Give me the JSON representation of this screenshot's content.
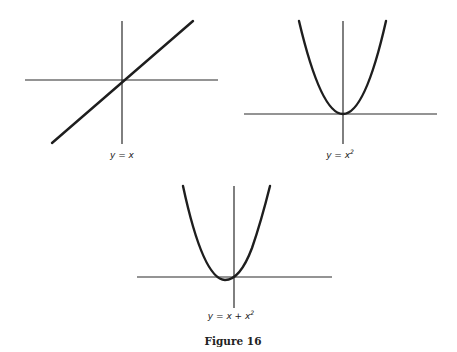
{
  "figure": {
    "caption": "Figure 16",
    "graphs": [
      {
        "id": "linear",
        "equation_prefix": "y = x",
        "equation_sup": "",
        "function": "y = x"
      },
      {
        "id": "square",
        "equation_prefix": "y = x",
        "equation_sup": "2",
        "function": "y = x^2"
      },
      {
        "id": "sum",
        "equation_prefix": "y = x + x",
        "equation_sup": "2",
        "function": "y = x + x^2"
      }
    ]
  },
  "colors": {
    "background": "#ffffff",
    "ink": "#1e1e1e"
  }
}
